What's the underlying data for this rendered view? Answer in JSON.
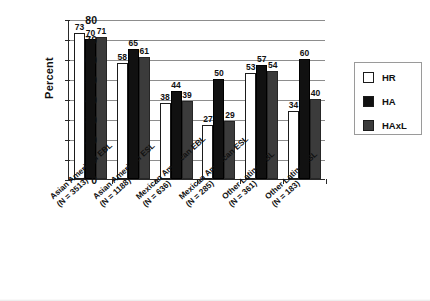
{
  "chart_data": {
    "type": "bar",
    "title": "",
    "xlabel": "",
    "ylabel": "Percent",
    "ylim": [
      0,
      80
    ],
    "ytick_step": 10,
    "yticks": [
      0,
      10,
      20,
      30,
      40,
      50,
      60,
      70,
      80
    ],
    "grid": true,
    "legend_position": "right",
    "categories": [
      "Asian American EBL (N = 3513)",
      "Asian American ESL (N = 1188)",
      "Mexican American EBL (N = 636)",
      "Mexican American ESL (N = 285)",
      "Other Latino EBL (N = 361)",
      "Other Latino ESL (N = 183)"
    ],
    "category_lines": [
      [
        "Asian American EBL",
        "(N = 3513)"
      ],
      [
        "Asian American ESL",
        "(N = 1188)"
      ],
      [
        "Mexican American EBL",
        "(N = 636)"
      ],
      [
        "Mexican American ESL",
        "(N = 285)"
      ],
      [
        "Other Latino EBL",
        "(N = 361)"
      ],
      [
        "Other Latino ESL",
        "(N = 183)"
      ]
    ],
    "series": [
      {
        "name": "HR",
        "color": "#ffffff",
        "values": [
          73,
          58,
          38,
          27,
          53,
          34
        ]
      },
      {
        "name": "HA",
        "color": "#111111",
        "values": [
          70,
          65,
          44,
          50,
          57,
          60
        ]
      },
      {
        "name": "HAxL",
        "color": "#3b3b3b",
        "values": [
          71,
          61,
          39,
          29,
          54,
          40
        ]
      }
    ]
  },
  "legend": {
    "items": [
      {
        "label": "HR"
      },
      {
        "label": "HA"
      },
      {
        "label": "HAxL"
      }
    ]
  }
}
